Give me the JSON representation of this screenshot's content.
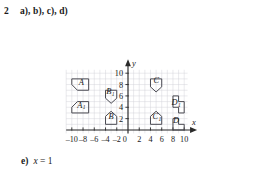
{
  "exercise": {
    "number": "2",
    "parts_label": "a), b), c), d)",
    "answer_label": "e)",
    "answer_variable": "x",
    "answer_equals": " = ",
    "answer_value": "1"
  },
  "chart_data": {
    "type": "scatter",
    "title": "",
    "xlabel": "x",
    "ylabel": "y",
    "xlim": [
      -11,
      10.6
    ],
    "ylim": [
      -0.6,
      10.6
    ],
    "grid": true,
    "grid_step": 1,
    "legend": "none",
    "x_ticks": [
      -10,
      -8,
      -6,
      -4,
      -2,
      0,
      2,
      4,
      6,
      8,
      10
    ],
    "x_tick_labels": [
      "-10",
      "-8",
      "-6",
      "-4",
      "-2",
      "0",
      "2",
      "4",
      "6",
      "8",
      "10"
    ],
    "y_ticks": [
      2,
      4,
      6,
      8,
      10
    ],
    "y_tick_labels": [
      "2",
      "4",
      "6",
      "8",
      "10"
    ],
    "shapes": [
      {
        "name": "A",
        "label": "A",
        "subscript": "",
        "label_at": [
          -8.3,
          8.0
        ],
        "points": [
          [
            -10,
            9
          ],
          [
            -7,
            9
          ],
          [
            -7,
            7
          ],
          [
            -9,
            7
          ],
          [
            -10,
            8
          ]
        ]
      },
      {
        "name": "A1",
        "label": "A",
        "subscript": "1",
        "label_at": [
          -8.3,
          3.95
        ],
        "points": [
          [
            -9,
            5
          ],
          [
            -7,
            5
          ],
          [
            -7,
            3
          ],
          [
            -10,
            3
          ],
          [
            -10,
            4
          ]
        ]
      },
      {
        "name": "B1",
        "label": "B",
        "subscript": "1",
        "label_at": [
          -3.15,
          6.35
        ],
        "points": [
          [
            -4,
            7
          ],
          [
            -2,
            7
          ],
          [
            -2,
            5.6
          ],
          [
            -3,
            4.7
          ],
          [
            -4,
            5.6
          ]
        ]
      },
      {
        "name": "B",
        "label": "B",
        "subscript": "",
        "label_at": [
          -3.0,
          1.85
        ],
        "points": [
          [
            -3,
            3.3
          ],
          [
            -2,
            2.4
          ],
          [
            -2,
            1
          ],
          [
            -4,
            1
          ],
          [
            -4,
            2.4
          ]
        ]
      },
      {
        "name": "C",
        "label": "C",
        "subscript": "",
        "label_at": [
          5.05,
          8.3
        ],
        "points": [
          [
            4,
            9
          ],
          [
            6,
            9
          ],
          [
            6,
            7.6
          ],
          [
            5,
            6.7
          ],
          [
            4,
            7.6
          ]
        ]
      },
      {
        "name": "C1",
        "label": "C",
        "subscript": "1",
        "label_at": [
          5.15,
          1.9
        ],
        "points": [
          [
            5,
            3.3
          ],
          [
            6,
            2.4
          ],
          [
            6,
            1
          ],
          [
            4,
            1
          ],
          [
            4,
            2.4
          ]
        ]
      },
      {
        "name": "D1",
        "label": "D",
        "subscript": "1",
        "label_at": [
          8.55,
          4.35
        ],
        "points": [
          [
            8,
            6
          ],
          [
            9,
            6
          ],
          [
            9,
            5
          ],
          [
            10,
            5
          ],
          [
            10,
            3
          ],
          [
            9,
            3
          ],
          [
            9,
            4
          ],
          [
            8,
            4
          ]
        ]
      },
      {
        "name": "D",
        "label": "D",
        "subscript": "",
        "label_at": [
          8.55,
          1.25
        ],
        "points": [
          [
            8,
            2
          ],
          [
            9,
            2
          ],
          [
            9,
            1
          ],
          [
            10,
            1
          ],
          [
            10,
            0
          ],
          [
            8,
            0
          ]
        ]
      }
    ]
  }
}
